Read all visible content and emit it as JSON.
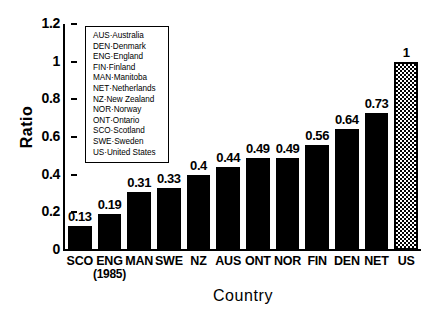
{
  "chart_data": {
    "type": "bar",
    "title": "",
    "xlabel": "Country",
    "ylabel": "Ratio",
    "categories": [
      "SCO",
      "ENG",
      "MAN",
      "SWE",
      "NZ",
      "AUS",
      "ONT",
      "NOR",
      "FIN",
      "DEN",
      "NET",
      "US"
    ],
    "category_sublabels": [
      "",
      "(1985)",
      "",
      "",
      "",
      "",
      "",
      "",
      "",
      "",
      "",
      ""
    ],
    "values": [
      0.13,
      0.19,
      0.31,
      0.33,
      0.4,
      0.44,
      0.49,
      0.49,
      0.56,
      0.64,
      0.73,
      1
    ],
    "value_labels": [
      "0.13",
      "0.19",
      "0.31",
      "0.33",
      "0.4",
      "0.44",
      "0.49",
      "0.49",
      "0.56",
      "0.64",
      "0.73",
      "1"
    ],
    "bar_styles": [
      "solid",
      "solid",
      "solid",
      "solid",
      "solid",
      "solid",
      "solid",
      "solid",
      "solid",
      "solid",
      "solid",
      "hatched"
    ],
    "ylim": [
      0,
      1.2
    ],
    "ytick_values": [
      0,
      0.2,
      0.4,
      0.6,
      0.8,
      1,
      1.2
    ],
    "ytick_labels": [
      "0",
      "0.2",
      "0.4",
      "0.6",
      "0.8",
      "1",
      "1.2"
    ],
    "grid": false,
    "legend_position": "upper-left-inside",
    "colors": {
      "bar_solid": "#000000",
      "bar_hatched_fill": "#ffffff",
      "axis": "#000000",
      "background": "#ffffff"
    }
  },
  "legend": {
    "entries": [
      "AUS·Australia",
      "DEN·Denmark",
      "ENG·England",
      "FIN·Finland",
      "MAN·Manitoba",
      "NET·Netherlands",
      "NZ·New Zealand",
      "NOR·Norway",
      "ONT·Ontario",
      "SCO·Scotland",
      "SWE·Sweden",
      "US·United States"
    ]
  }
}
